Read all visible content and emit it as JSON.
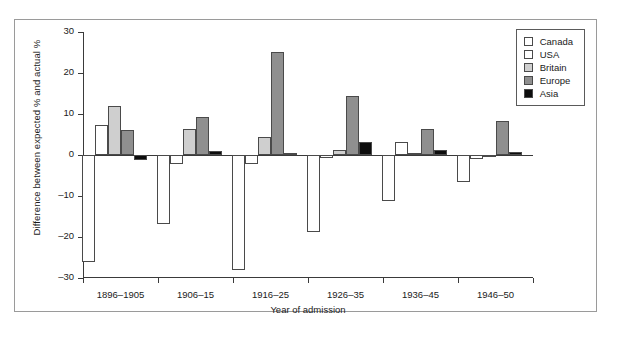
{
  "chart_data": {
    "type": "bar",
    "title": "",
    "xlabel": "Year of admission",
    "ylabel": "Difference between expected % and actual %",
    "categories": [
      "1896–1905",
      "1906–15",
      "1916–25",
      "1926–35",
      "1936–45",
      "1946–50"
    ],
    "ylim": [
      -30,
      30
    ],
    "yticks": [
      30,
      20,
      10,
      0,
      -10,
      -20,
      -30
    ],
    "ytick_labels": [
      "30",
      "20",
      "10",
      "0",
      "–10",
      "–20",
      "–30"
    ],
    "grid": false,
    "legend_position": "top-right",
    "series": [
      {
        "name": "Canada",
        "color": "#ffffff",
        "values": [
          -26.0,
          -16.8,
          -28.0,
          -18.7,
          -11.1,
          -6.7
        ]
      },
      {
        "name": "USA",
        "color": "#ffffff",
        "values": [
          7.2,
          -2.1,
          -2.2,
          -0.7,
          3.2,
          -0.9
        ]
      },
      {
        "name": "Britain",
        "color": "#cfcfcf",
        "values": [
          12.0,
          6.4,
          4.3,
          1.3,
          0.6,
          -0.3
        ]
      },
      {
        "name": "Europe",
        "color": "#8f8f8f",
        "values": [
          6.2,
          9.2,
          25.1,
          14.3,
          6.4,
          8.3
        ]
      },
      {
        "name": "Asia",
        "color": "#0d0d0d",
        "values": [
          -1.1,
          1.0,
          0.6,
          3.2,
          1.3,
          0.8
        ]
      }
    ]
  },
  "legend": {
    "items": [
      {
        "label": "Canada",
        "color": "#ffffff"
      },
      {
        "label": "USA",
        "color": "#ffffff"
      },
      {
        "label": "Britain",
        "color": "#cfcfcf"
      },
      {
        "label": "Europe",
        "color": "#8f8f8f"
      },
      {
        "label": "Asia",
        "color": "#0d0d0d"
      }
    ]
  }
}
